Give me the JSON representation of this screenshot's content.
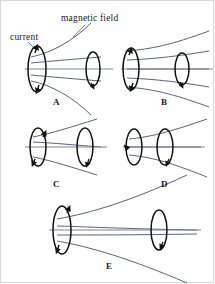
{
  "figure": {
    "type": "physics-diagram",
    "background_color": "#ffffff",
    "coil_color": "#111111",
    "field_line_color": "#46526b",
    "axis_color": "#7a8496",
    "label_color": "#1a1a1a"
  },
  "annotations": [
    {
      "id": "current",
      "text": "current",
      "x": 9,
      "y": 31
    },
    {
      "id": "magnetic-field",
      "text": "magnetic field",
      "x": 60,
      "y": 12
    }
  ],
  "choices": [
    {
      "id": "A",
      "label": "A",
      "x": 52,
      "y": 96
    },
    {
      "id": "B",
      "label": "B",
      "x": 160,
      "y": 96
    },
    {
      "id": "C",
      "label": "C",
      "x": 52,
      "y": 178
    },
    {
      "id": "D",
      "label": "D",
      "x": 160,
      "y": 178
    },
    {
      "id": "E",
      "label": "E",
      "x": 105,
      "y": 260
    }
  ],
  "panels": [
    {
      "id": "A",
      "left_coil": {
        "cx": 36,
        "cy": 68,
        "rx": 9,
        "ry": 23
      },
      "right_coil": {
        "cx": 92,
        "cy": 68,
        "rx": 7,
        "ry": 17
      },
      "field_lines": 3,
      "shape": "diverging-outward"
    },
    {
      "id": "B",
      "left_coil": {
        "cx": 130,
        "cy": 68,
        "rx": 8,
        "ry": 21
      },
      "right_coil": {
        "cx": 181,
        "cy": 68,
        "rx": 7,
        "ry": 16
      },
      "field_lines": 5,
      "shape": "nearly-parallel"
    },
    {
      "id": "C",
      "left_coil": {
        "cx": 37,
        "cy": 146,
        "rx": 8,
        "ry": 19
      },
      "right_coil": {
        "cx": 84,
        "cy": 146,
        "rx": 8,
        "ry": 19
      },
      "field_lines": 3,
      "shape": "pinched-middle"
    },
    {
      "id": "D",
      "left_coil": {
        "cx": 133,
        "cy": 146,
        "rx": 8,
        "ry": 18
      },
      "right_coil": {
        "cx": 164,
        "cy": 146,
        "rx": 8,
        "ry": 18
      },
      "field_lines": 3,
      "shape": "diverging-right"
    },
    {
      "id": "E",
      "left_coil": {
        "cx": 61,
        "cy": 229,
        "rx": 9,
        "ry": 24
      },
      "right_coil": {
        "cx": 158,
        "cy": 229,
        "rx": 8,
        "ry": 20
      },
      "field_lines": 3,
      "shape": "wide-flare"
    }
  ]
}
